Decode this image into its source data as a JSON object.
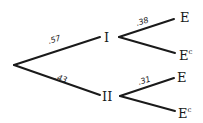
{
  "diagram": {
    "type": "probability-tree",
    "root": {
      "children": [
        {
          "label": "I",
          "probability": ".57",
          "children": [
            {
              "label": "E",
              "superscript": "",
              "probability": ".38"
            },
            {
              "label": "E",
              "superscript": "c",
              "probability": ""
            }
          ]
        },
        {
          "label": "II",
          "probability": ".43",
          "children": [
            {
              "label": "E",
              "superscript": "",
              "probability": ".31"
            },
            {
              "label": "E",
              "superscript": "c",
              "probability": ""
            }
          ]
        }
      ]
    }
  }
}
